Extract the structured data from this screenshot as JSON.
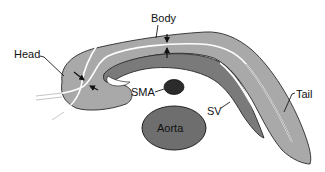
{
  "figure": {
    "labels": {
      "head": "Head",
      "body": "Body",
      "tail": "Tail",
      "sma": "SMA",
      "sv": "SV",
      "aorta": "Aorta"
    },
    "colors": {
      "pancreas_fill": "#a9a9a9",
      "splenic_vein_fill": "#7a7a7a",
      "sma_fill": "#2b2b2b",
      "aorta_fill": "#6e6e6e",
      "outline": "#2a2a2a",
      "duct": "#ffffff",
      "background": "#ffffff"
    }
  }
}
